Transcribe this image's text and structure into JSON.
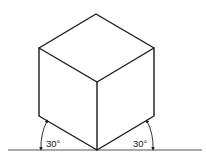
{
  "diagram": {
    "labels": {
      "left_angle": "30°",
      "right_angle": "30°"
    },
    "colors": {
      "stroke": "#1a1a1a",
      "ground": "#555555",
      "background": "#ffffff"
    }
  }
}
